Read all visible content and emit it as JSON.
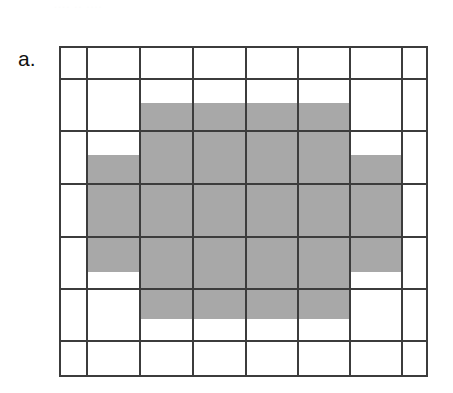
{
  "figure": {
    "panel_label": "a.",
    "top_clipped_text": "....  ..  ....",
    "colors": {
      "background": "#ffffff",
      "grid_line": "#3c3c3c",
      "shaded_fill": "#a8a8a8"
    }
  },
  "chart_data": {
    "type": "heatmap",
    "title": "a.",
    "xlabel": "",
    "ylabel": "",
    "grid": {
      "columns": 8,
      "rows": 7,
      "column_edges_px": [
        0,
        28,
        81,
        134,
        187,
        239,
        291,
        343,
        369
      ],
      "row_edges_px": [
        0,
        33,
        85,
        138,
        191,
        243,
        295,
        331
      ],
      "gridlines": true,
      "outer_border": true
    },
    "shaded_region": {
      "fill": "#a8a8a8",
      "shape": "plus",
      "blocks_px": [
        {
          "name": "top-arm",
          "x": 81,
          "y": 57,
          "width": 210,
          "height": 52
        },
        {
          "name": "middle-bar",
          "x": 28,
          "y": 109,
          "width": 315,
          "height": 117
        },
        {
          "name": "bottom-arm",
          "x": 81,
          "y": 226,
          "width": 210,
          "height": 47
        }
      ]
    },
    "legend": null,
    "annotations": []
  }
}
